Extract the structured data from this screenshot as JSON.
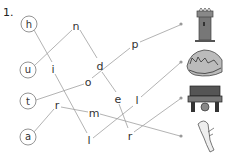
{
  "exercise": {
    "number": "1.",
    "start_letters": [
      {
        "label": "h",
        "x": 29,
        "y": 24
      },
      {
        "label": "u",
        "x": 28,
        "y": 70
      },
      {
        "label": "t",
        "x": 28,
        "y": 101
      },
      {
        "label": "a",
        "x": 28,
        "y": 137
      }
    ],
    "letters": [
      {
        "label": "n",
        "x": 76,
        "y": 26
      },
      {
        "label": "i",
        "x": 53,
        "y": 70
      },
      {
        "label": "d",
        "x": 100,
        "y": 67
      },
      {
        "label": "o",
        "x": 88,
        "y": 83
      },
      {
        "label": "p",
        "x": 135,
        "y": 44
      },
      {
        "label": "r",
        "x": 57,
        "y": 106
      },
      {
        "label": "m",
        "x": 94,
        "y": 113
      },
      {
        "label": "e",
        "x": 118,
        "y": 100
      },
      {
        "label": "l",
        "x": 137,
        "y": 101
      },
      {
        "label": "l",
        "x": 89,
        "y": 141
      },
      {
        "label": "r",
        "x": 130,
        "y": 137
      }
    ],
    "pictures": [
      {
        "name": "tower",
        "dot_x": 181,
        "dot_y": 24
      },
      {
        "name": "hat",
        "dot_x": 181,
        "dot_y": 62
      },
      {
        "name": "bench",
        "dot_x": 181,
        "dot_y": 98
      },
      {
        "name": "wing",
        "dot_x": 181,
        "dot_y": 136
      }
    ],
    "line_color": "#9a9a9a"
  }
}
